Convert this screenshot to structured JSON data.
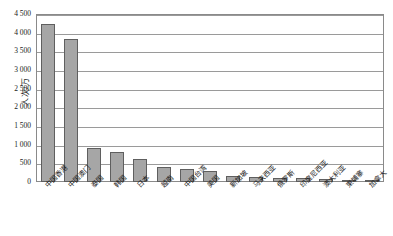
{
  "chart_data": {
    "type": "bar",
    "title": "",
    "xlabel": "",
    "ylabel": "人次/万",
    "ylim": [
      0,
      4500
    ],
    "ytick_step": 500,
    "ytick_labels": [
      "0",
      "500",
      "1 000",
      "1 500",
      "2 000",
      "2 500",
      "3 000",
      "3 500",
      "4 000",
      "4 500"
    ],
    "ytick_values": [
      0,
      500,
      1000,
      1500,
      2000,
      2500,
      3000,
      3500,
      4000,
      4500
    ],
    "grid": "horizontal",
    "legend": "none",
    "bar_color": "#a6a6a6",
    "bar_edge_color": "#5f5f5f",
    "categories": [
      "中国香港",
      "中国澳门",
      "泰国",
      "韩国",
      "日本",
      "越南",
      "中国台湾",
      "美国",
      "新加坡",
      "马来西亚",
      "俄罗斯",
      "印度尼西亚",
      "澳大利亚",
      "柬埔寨",
      "加拿大"
    ],
    "values": [
      4230,
      3820,
      910,
      800,
      610,
      400,
      340,
      290,
      165,
      125,
      110,
      100,
      85,
      65,
      55
    ]
  }
}
